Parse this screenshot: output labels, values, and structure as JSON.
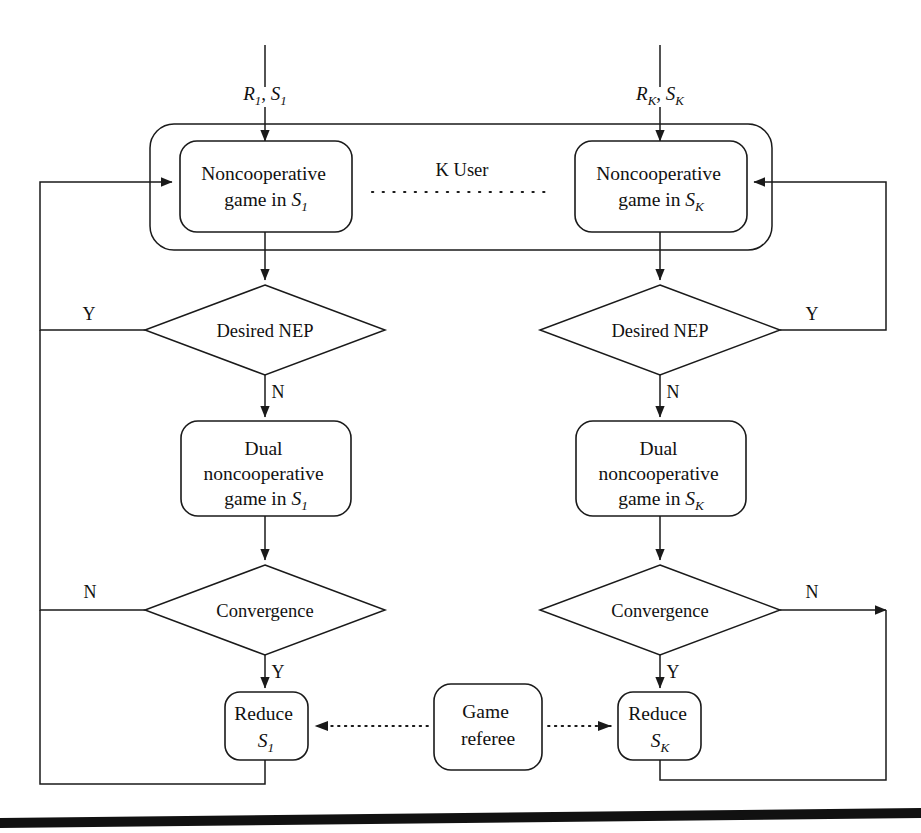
{
  "figure": {
    "kind": "flowchart",
    "background": "#ffffff",
    "line_color": "#1a1a1a",
    "bottom_rule": true
  },
  "inputs": [
    {
      "id": "in_1",
      "prefix": "R",
      "prefix_sub": "1",
      "sep": ", ",
      "second": "S",
      "second_sub": "1",
      "plain": "R1, S1"
    },
    {
      "id": "in_K",
      "prefix": "R",
      "prefix_sub": "K",
      "sep": ", ",
      "second": "S",
      "second_sub": "K",
      "plain": "RK, SK"
    }
  ],
  "group": {
    "label": "K User",
    "dots_note": "dotted separator between user 1 and user K"
  },
  "columns": [
    {
      "id": "user_1",
      "index_label": "1",
      "nodes": {
        "game": {
          "line1": "Noncooperative",
          "line2_pre": "game in ",
          "line2_sym": "S",
          "line2_sub": "1",
          "plain": "Noncooperative game in S1"
        },
        "nep": {
          "label": "Desired NEP"
        },
        "dual": {
          "line1": "Dual",
          "line2": "noncooperative",
          "line3_pre": "game in ",
          "line3_sym": "S",
          "line3_sub": "1",
          "plain": "Dual noncooperative game in S1"
        },
        "convergence": {
          "label": "Convergence"
        },
        "reduce": {
          "line1": "Reduce",
          "line2_sym": "S",
          "line2_sub": "1",
          "plain": "Reduce S1"
        }
      },
      "edges": {
        "nep_yes": "Y",
        "nep_no": "N",
        "conv_no": "N",
        "conv_yes": "Y"
      }
    },
    {
      "id": "user_K",
      "index_label": "K",
      "nodes": {
        "game": {
          "line1": "Noncooperative",
          "line2_pre": "game in ",
          "line2_sym": "S",
          "line2_sub": "K",
          "plain": "Noncooperative game in SK"
        },
        "nep": {
          "label": "Desired NEP"
        },
        "dual": {
          "line1": "Dual",
          "line2": "noncooperative",
          "line3_pre": "game in ",
          "line3_sym": "S",
          "line3_sub": "K",
          "plain": "Dual noncooperative game in SK"
        },
        "convergence": {
          "label": "Convergence"
        },
        "reduce": {
          "line1": "Reduce",
          "line2_sym": "S",
          "line2_sub": "K",
          "plain": "Reduce SK"
        }
      },
      "edges": {
        "nep_yes": "Y",
        "nep_no": "N",
        "conv_no": "N",
        "conv_yes": "Y"
      }
    }
  ],
  "referee": {
    "line1": "Game",
    "line2": "referee",
    "plain": "Game referee"
  }
}
